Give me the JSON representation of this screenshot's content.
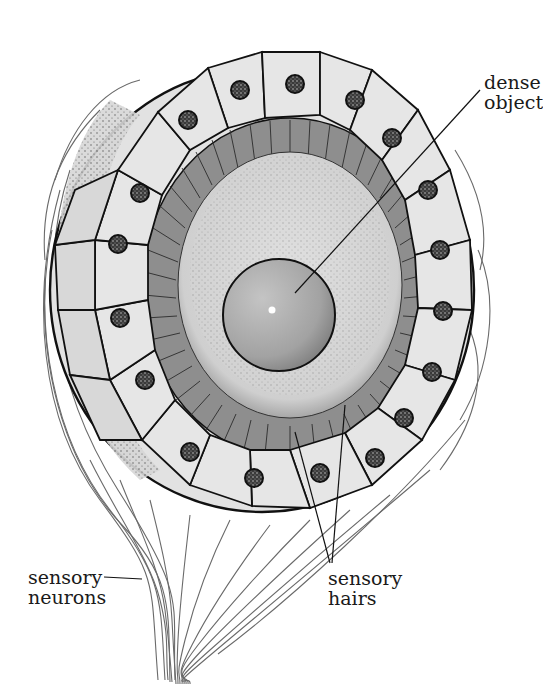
{
  "diagram": {
    "labels": {
      "dense_object": {
        "line1": "dense",
        "line2": "object"
      },
      "sensory_neurons": {
        "line1": "sensory",
        "line2": "neurons"
      },
      "sensory_hairs": {
        "line1": "sensory",
        "line2": "hairs"
      }
    },
    "parts": [
      "outer ring of receptor cells with dark nuclei",
      "band of sensory hairs",
      "fluid-filled cavity (stippled)",
      "dense object (statolith)",
      "bundle of sensory neurons"
    ],
    "colors": {
      "background": "#ffffff",
      "cell_fill": "#e6e6e6",
      "hair_band": "#8e8e8e",
      "cavity": "#d4d4d4",
      "statolith": "#a9a9a9",
      "nucleus": "#2a2a2a",
      "outline": "#111111",
      "neuron_line": "#6a6a6a"
    }
  }
}
